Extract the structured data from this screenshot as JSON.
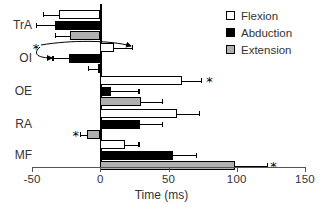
{
  "chart_data": {
    "type": "bar",
    "orientation": "horizontal",
    "title": "",
    "xlabel": "Time (ms)",
    "ylabel": "",
    "xlim": [
      -50,
      150
    ],
    "xticks": [
      -50,
      0,
      50,
      100,
      150
    ],
    "xtick_labels": [
      "-50",
      "0",
      "50",
      "100",
      "150"
    ],
    "grid": false,
    "legend_position": "top-right",
    "categories": [
      "TrA",
      "OI",
      "OE",
      "RA",
      "MF"
    ],
    "series": [
      {
        "name": "Flexion",
        "color": "#ffffff",
        "values": [
          -30,
          10,
          60,
          56,
          18
        ],
        "errors_low": [
          -42,
          -3,
          47,
          44,
          11
        ],
        "errors_high": [
          -19,
          23,
          74,
          72,
          28
        ]
      },
      {
        "name": "Abduction",
        "color": "#000000",
        "values": [
          -33,
          -23,
          8,
          29,
          53
        ],
        "errors_low": [
          -47,
          -35,
          -1,
          20,
          44
        ],
        "errors_high": [
          -23,
          -14,
          28,
          45,
          70
        ]
      },
      {
        "name": "Extension",
        "color": "#b0b0b0",
        "values": [
          -22,
          -2,
          30,
          -10,
          99
        ],
        "errors_low": [
          -33,
          -9,
          18,
          -15,
          88
        ],
        "errors_high": [
          -15,
          2,
          45,
          -7,
          122
        ]
      }
    ],
    "annotations": [
      {
        "label": "*",
        "category": "OE",
        "series": "Flexion",
        "x": 80
      },
      {
        "label": "*",
        "category": "RA",
        "series": "Extension",
        "x": -18
      },
      {
        "label": "*",
        "category": "MF",
        "series": "Extension",
        "x": 127
      },
      {
        "label": "*",
        "category": "OI",
        "series": "Flexion",
        "x": -47
      }
    ],
    "arrow_annotations": [
      {
        "from_category": "OI",
        "to_series": "Flexion",
        "description": "curved arrow from asterisk to flexion bar onset"
      },
      {
        "from_category": "OI",
        "to_series": "Abduction",
        "description": "curved arrow from asterisk to abduction bar error cap"
      }
    ]
  },
  "legend": {
    "items": [
      {
        "label": "Flexion",
        "color": "#ffffff"
      },
      {
        "label": "Abduction",
        "color": "#000000"
      },
      {
        "label": "Extension",
        "color": "#b0b0b0"
      }
    ]
  },
  "axis": {
    "x_title": "Time (ms)",
    "tick_labels": [
      "-50",
      "0",
      "50",
      "100",
      "150"
    ],
    "category_labels": [
      "TrA",
      "OI",
      "OE",
      "RA",
      "MF"
    ]
  },
  "caption": {
    "text": ""
  }
}
